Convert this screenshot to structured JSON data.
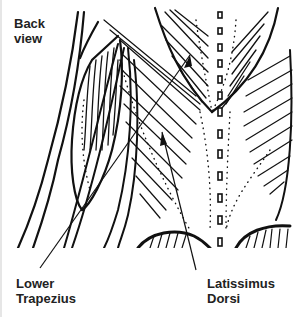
{
  "labels": {
    "view": [
      "Back",
      "view"
    ],
    "lower_trapezius": [
      "Lower",
      "Trapezius"
    ],
    "latissimus_dorsi": [
      "Latissimus",
      "Dorsi"
    ]
  },
  "colors": {
    "ink": "#111111",
    "background": "#ffffff"
  }
}
